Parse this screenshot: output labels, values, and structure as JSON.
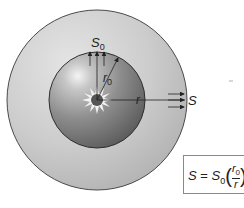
{
  "diagram": {
    "type": "radiating-sphere-flux",
    "labels": {
      "surface_flux": "S",
      "surface_flux_sub": "0",
      "inner_radius": "r",
      "inner_radius_sub": "0",
      "distance": "r",
      "outer_flux": "S"
    },
    "formula": {
      "lhs": "S",
      "eq": "=",
      "coef": "S",
      "coef_sub": "0",
      "numerator": "r",
      "numerator_sub": "0",
      "denominator": "r",
      "exponent": "2"
    },
    "colors": {
      "outer_shell": "#c8c8c8",
      "inner_sphere": "#8c8c8c",
      "outline": "#3a3a3a",
      "arrow": "#222222"
    },
    "bottom_caption_partial": "S i e w l l n t n b"
  }
}
